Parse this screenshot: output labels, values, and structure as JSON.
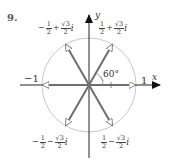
{
  "problem_number": "9.",
  "axes": {
    "x_label": "x",
    "y_label": "y"
  },
  "axis_ticks": {
    "neg_one": "−1",
    "pos_one": "1"
  },
  "angle_label": "60°",
  "roots": [
    {
      "id": "q1",
      "sign_re": "",
      "re_num": "1",
      "re_den": "2",
      "op": "+",
      "im_num": "√3",
      "im_den": "2",
      "unit": "i"
    },
    {
      "id": "q2",
      "sign_re": "−",
      "re_num": "1",
      "re_den": "2",
      "op": "+",
      "im_num": "√3",
      "im_den": "2",
      "unit": "i"
    },
    {
      "id": "q3",
      "sign_re": "−",
      "re_num": "1",
      "re_den": "2",
      "op": "−",
      "im_num": "√3",
      "im_den": "2",
      "unit": "i"
    },
    {
      "id": "q4",
      "sign_re": "",
      "re_num": "1",
      "re_den": "2",
      "op": "−",
      "im_num": "√3",
      "im_den": "2",
      "unit": "i"
    }
  ],
  "colors": {
    "circle": "#c8c8c8",
    "vector": "#6e6e6e",
    "axis": "#222222"
  }
}
